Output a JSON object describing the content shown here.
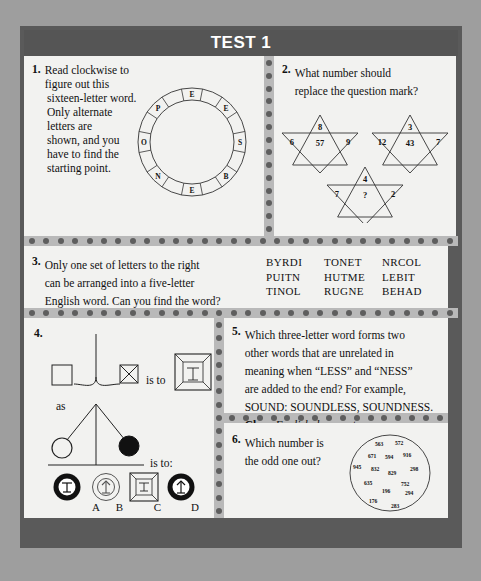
{
  "header": {
    "title": "TEST 1"
  },
  "puzzles": {
    "q1": {
      "number": "1.",
      "line1": "Read clockwise to figure out this",
      "line2": "sixteen-letter word.",
      "body": "Only alternate letters are shown, and you have to find the starting point.",
      "circle_letters": [
        "E",
        "E",
        "S",
        "B",
        "E",
        "N",
        "O",
        "P"
      ],
      "segments": 16
    },
    "q2": {
      "number": "2.",
      "line1": "What number should",
      "line2": "replace the question mark?",
      "figures": [
        {
          "top": "8",
          "left": "6",
          "center": "57",
          "right": "9"
        },
        {
          "top": "3",
          "left": "12",
          "center": "43",
          "right": "7"
        },
        {
          "top": "4",
          "left": "7",
          "center": "?",
          "right": "2"
        }
      ]
    },
    "q3": {
      "number": "3.",
      "line1": "Only one set of letters to the right",
      "line2": "can be arranged into a five-letter",
      "line3": "English word. Can you find the word?",
      "sets": [
        [
          "BYRDI",
          "TONET",
          "NRCOL"
        ],
        [
          "PUITN",
          "HUTME",
          "LEBIT"
        ],
        [
          "TINOL",
          "RUGNE",
          "BEHAD"
        ]
      ]
    },
    "q4": {
      "number": "4.",
      "is_to_1": "is to",
      "as_label": "as",
      "is_to_2": "is to:",
      "options": [
        "A",
        "B",
        "C",
        "D"
      ]
    },
    "q5": {
      "number": "5.",
      "line1": "Which three-letter word forms two",
      "line2": "other words that are unrelated in",
      "line3": "meaning when “LESS” and “NESS”",
      "line4": "are added to the end? For example,",
      "line5": "SOUND: SOUNDLESS, SOUNDNESS.",
      "clue_label": "Clue:",
      "clue_text": "Foolish deponent"
    },
    "q6": {
      "number": "6.",
      "line1": "Which number is",
      "line2": "the odd one out?",
      "numbers": [
        "563",
        "572",
        "671",
        "594",
        "916",
        "945",
        "832",
        "829",
        "298",
        "635",
        "752",
        "196",
        "294",
        "176",
        "283"
      ]
    }
  },
  "colors": {
    "page_bg": "#9e9e9e",
    "frame": "#5a5a5a",
    "header_bg": "#555555",
    "panel_bg": "#f2f2f0",
    "divider_bg": "#b9b9b9",
    "dot": "#5e5e5e",
    "ink": "#111111"
  }
}
